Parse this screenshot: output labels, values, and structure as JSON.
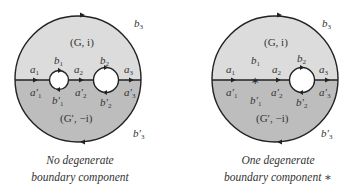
{
  "colors": {
    "upper_region": "#dcdcdc",
    "lower_region": "#bdbdbd",
    "stroke": "#222222",
    "hole": "#ffffff",
    "text": "#333333"
  },
  "diagrams": [
    {
      "id": "left",
      "upper_region_label": "(G, i)",
      "lower_region_label": "(G′, −i)",
      "labels": {
        "a1": "a",
        "a1_sub": "1",
        "a2": "a",
        "a2_sub": "2",
        "a3": "a",
        "a3_sub": "3",
        "a1p": "a′",
        "a1p_sub": "1",
        "a2p": "a′",
        "a2p_sub": "2",
        "a3p": "a′",
        "a3p_sub": "3",
        "b1": "b",
        "b1_sub": "1",
        "b2": "b",
        "b2_sub": "2",
        "b3": "b",
        "b3_sub": "3",
        "b1p": "b′",
        "b1p_sub": "1",
        "b2p": "b′",
        "b2p_sub": "2",
        "b3p": "b′",
        "b3p_sub": "3"
      },
      "caption_line1": "No degenerate",
      "caption_line2": "boundary component"
    },
    {
      "id": "right",
      "upper_region_label": "(G, i)",
      "lower_region_label": "(G′, −i)",
      "degenerate_marker": "∗",
      "labels": {
        "a1": "a",
        "a1_sub": "1",
        "a2": "a",
        "a2_sub": "2",
        "a3": "a",
        "a3_sub": "3",
        "a1p": "a′",
        "a1p_sub": "1",
        "a2p": "a′",
        "a2p_sub": "2",
        "a3p": "a′",
        "a3p_sub": "3",
        "b1": "b",
        "b1_sub": "1",
        "b2": "b",
        "b2_sub": "2",
        "b3": "b",
        "b3_sub": "3",
        "b1p": "b′",
        "b1p_sub": "1",
        "b2p": "b′",
        "b2p_sub": "2",
        "b3p": "b′",
        "b3p_sub": "3"
      },
      "caption_line1": "One degenerate",
      "caption_line2": "boundary component ∗"
    }
  ]
}
